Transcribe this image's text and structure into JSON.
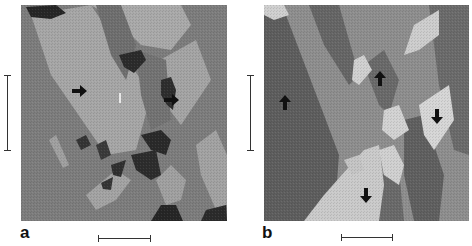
{
  "figure": {
    "panels": [
      {
        "id": "a",
        "label": "a",
        "image_kind": "grayscale domain map",
        "arrows": [
          {
            "direction": "right",
            "x": 80,
            "y": 91
          },
          {
            "direction": "right",
            "x": 172,
            "y": 100
          }
        ],
        "scale_bar_vertical": true,
        "scale_bar_horizontal": true
      },
      {
        "id": "b",
        "label": "b",
        "image_kind": "grayscale domain map",
        "arrows": [
          {
            "direction": "up",
            "x": 285,
            "y": 103
          },
          {
            "direction": "up",
            "x": 380,
            "y": 79
          },
          {
            "direction": "down",
            "x": 437,
            "y": 117
          },
          {
            "direction": "down",
            "x": 366,
            "y": 196
          }
        ],
        "scale_bar_vertical": true,
        "scale_bar_horizontal": true
      }
    ],
    "colors": {
      "background": "#ffffff",
      "gray_dark": "#2a2a2a",
      "gray_mid_dark": "#6e6e6e",
      "gray_mid": "#8c8c8c",
      "gray_light": "#a8a8a8",
      "gray_bright": "#cfcfcf",
      "arrow": "#111111",
      "scale_bar": "#333333"
    }
  }
}
